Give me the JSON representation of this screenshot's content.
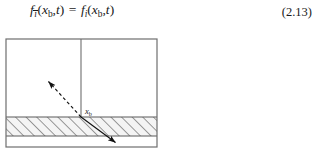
{
  "equation": {
    "id": "eq-2-13",
    "number": "(2.13)",
    "lhs": {
      "function": "f",
      "subscript": "i",
      "subscript_overbar": true,
      "args": [
        "x",
        "b",
        "t"
      ]
    },
    "relation": "=",
    "rhs": {
      "function": "f",
      "subscript": "i",
      "subscript_overbar": false,
      "args": [
        "x",
        "b",
        "t"
      ]
    },
    "plain_text": "f_ibar(x_b,t) = f_i(x_b,t)",
    "tokens": {
      "f": "f",
      "i": "i",
      "x": "x",
      "b": "b",
      "t": "t",
      "comma": ",",
      "equals": "=",
      "open_paren": "(",
      "close_paren": ")"
    }
  },
  "figure": {
    "name": "boundary-node-diagram",
    "label_xb": {
      "base": "x",
      "sub": "b"
    },
    "colors": {
      "frame_stroke": "#6e6e6e",
      "divider_stroke": "#6e6e6e",
      "hatch_stroke": "#5a5a5a",
      "hatch_fill": "#f2f2f2",
      "arrow_stroke": "#111111",
      "background": "#ffffff",
      "text": "#1a1a1a"
    },
    "geometry": {
      "frame": {
        "x": 6,
        "y": 11,
        "width": 151,
        "height": 108
      },
      "divider_x": 81,
      "hatch_band": {
        "y": 89,
        "height": 19
      },
      "arrow": {
        "tip_upper_left": {
          "x": 47,
          "y": 52
        },
        "tip_lower_right": {
          "x": 117,
          "y": 116
        },
        "interface_point": {
          "x": 81,
          "y": 89
        },
        "upper_style": "dashed",
        "lower_style": "solid",
        "double_headed": true
      }
    }
  }
}
